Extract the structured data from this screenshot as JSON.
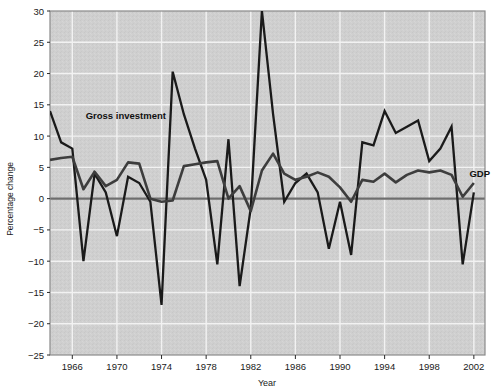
{
  "chart_data": {
    "type": "line",
    "title": "",
    "xlabel": "Year",
    "ylabel": "Percentage change",
    "xlim": [
      1964,
      2003
    ],
    "ylim": [
      -25,
      30
    ],
    "ytick_values": [
      30,
      25,
      20,
      15,
      10,
      5,
      0,
      -5,
      -10,
      -15,
      -20,
      -25
    ],
    "ytick_labels": [
      "30",
      "25",
      "20",
      "15",
      "10",
      "5",
      "0",
      "−5",
      "−10",
      "−15",
      "−20",
      "−25"
    ],
    "xtick_values": [
      1966,
      1970,
      1974,
      1978,
      1982,
      1986,
      1990,
      1994,
      1998,
      2002
    ],
    "xtick_labels": [
      "1966",
      "1970",
      "1974",
      "1978",
      "1982",
      "1986",
      "1990",
      "1994",
      "1998",
      "2002"
    ],
    "grid": true,
    "grid_color": "#f2f2f2",
    "plot_background": "#cfcfcf",
    "line_color": "#1a1a1a",
    "zero_line_color": "#6e6e6e",
    "legend_position": "inline-annotations",
    "annotations": [
      {
        "text": "Gross investment",
        "x": 1967.2,
        "y": 12.7,
        "series": "Gross investment"
      },
      {
        "text": "GDP",
        "x": 2001.6,
        "y": 3.4,
        "series": "GDP"
      }
    ],
    "x": [
      1964,
      1965,
      1966,
      1967,
      1968,
      1969,
      1970,
      1971,
      1972,
      1973,
      1974,
      1975,
      1976,
      1977,
      1978,
      1979,
      1980,
      1981,
      1982,
      1983,
      1984,
      1985,
      1986,
      1987,
      1988,
      1989,
      1990,
      1991,
      1992,
      1993,
      1994,
      1995,
      1996,
      1997,
      1998,
      1999,
      2000,
      2001,
      2002
    ],
    "series": [
      {
        "name": "Gross investment",
        "values": [
          14.0,
          9.0,
          8.0,
          -10.0,
          4.0,
          1.0,
          -6.0,
          3.5,
          2.5,
          -0.5,
          -17.0,
          20.3,
          13.5,
          8.0,
          3.0,
          -10.5,
          9.5,
          -14.0,
          -1.5,
          30.0,
          13.5,
          -0.5,
          2.5,
          4.0,
          1.0,
          -8.0,
          -0.5,
          -9.0,
          9.0,
          8.5,
          14.0,
          10.5,
          11.5,
          12.5,
          6.0,
          8.0,
          11.5,
          -10.5,
          1.0
        ]
      },
      {
        "name": "GDP",
        "values": [
          6.2,
          6.5,
          6.7,
          1.5,
          4.3,
          2.0,
          3.0,
          5.8,
          5.6,
          0.0,
          -0.5,
          -0.3,
          5.2,
          5.5,
          5.8,
          6.0,
          0.0,
          2.0,
          -2.0,
          4.5,
          7.2,
          4.0,
          3.0,
          3.5,
          4.2,
          3.5,
          1.8,
          -0.5,
          3.0,
          2.7,
          4.0,
          2.6,
          3.8,
          4.5,
          4.2,
          4.5,
          3.8,
          0.3,
          2.5
        ]
      }
    ]
  },
  "axis": {
    "ylabel": "Percentage change",
    "xlabel": "Year"
  }
}
